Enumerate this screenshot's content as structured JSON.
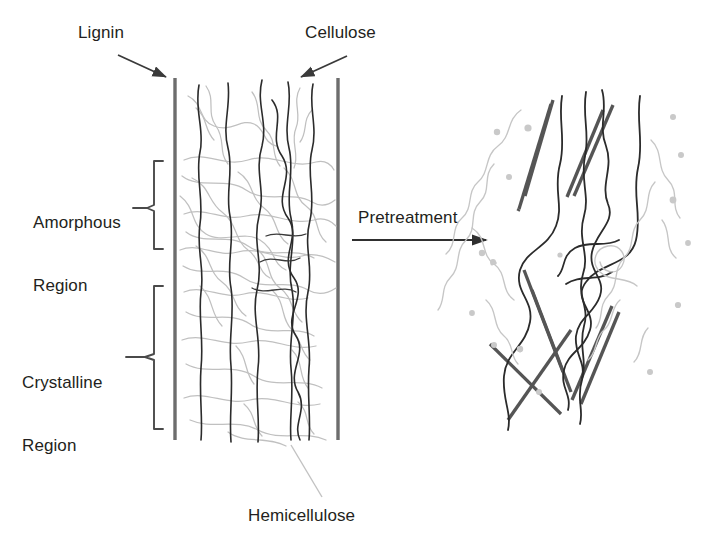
{
  "figure": {
    "width": 711,
    "height": 549,
    "background_color": "#ffffff"
  },
  "labels": {
    "lignin": "Lignin",
    "cellulose": "Cellulose",
    "amorphous_region_line1": "Amorphous",
    "amorphous_region_line2": "Region",
    "crystalline_region_line1": "Crystalline",
    "crystalline_region_line2": "Region",
    "pretreatment": "Pretreatment",
    "hemicellulose": "Hemicellulose"
  },
  "colors": {
    "text": "#231f20",
    "lignin_sheath": "#6d6d6d",
    "cellulose_fibril": "#2b2b2b",
    "hemicellulose_strand": "#b8b8b8",
    "arrow": "#3a3a3a",
    "bracket": "#4a4a4a",
    "dot": "#c9c9c9"
  },
  "annotations": {
    "lignin_arrow": {
      "from_x": 118,
      "from_y": 55,
      "to_x": 170,
      "to_y": 79
    },
    "cellulose_arrow": {
      "from_x": 347,
      "from_y": 56,
      "to_x": 297,
      "to_y": 79
    },
    "pretreatment_arrow": {
      "from_x": 352,
      "from_y": 240,
      "to_x": 491,
      "to_y": 240
    },
    "hemicellulose_leader": {
      "from_x": 322,
      "from_y": 498,
      "to_x": 293,
      "to_y": 446
    },
    "amorphous_bracket": {
      "x": 152,
      "y_top": 160,
      "y_bottom": 250,
      "tick_x": 133,
      "tick_y": 208
    },
    "crystalline_bracket": {
      "x": 152,
      "y_top": 285,
      "y_bottom": 430,
      "tick_x": 126,
      "tick_y": 357
    }
  },
  "structure_before": {
    "description": "Intact plant cell wall: two thick lignin sheath lines enclosing cellulose microfibrils wrapped by hemicellulose",
    "lignin_lines_x": [
      175,
      338
    ],
    "lignin_y_top": 78,
    "lignin_y_bottom": 440,
    "cellulose_microfibril_count": 6,
    "amorphous_region": {
      "y_top": 160,
      "y_bottom": 250
    },
    "crystalline_region": {
      "y_top": 285,
      "y_bottom": 430
    }
  },
  "structure_after": {
    "description": "Pretreated biomass: lignin fragmented into scattered tilted rods, hemicellulose solubilised and dispersed, cellulose chains exposed",
    "lignin_fragment_count": 9,
    "cellulose_chain_count": 4,
    "hemicellulose_fragment_count": 4,
    "dot_count": 12
  }
}
